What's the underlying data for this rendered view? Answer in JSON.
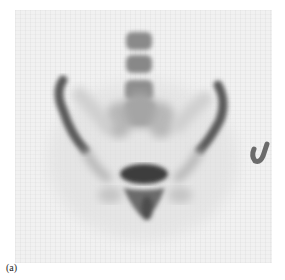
{
  "figure": {
    "caption": "(a)",
    "colors": {
      "background": "#f1f1f1",
      "uptake_dark": "#3a3a3a",
      "uptake_light": "#9a9a9a",
      "marker": "#6a6a6a"
    }
  }
}
